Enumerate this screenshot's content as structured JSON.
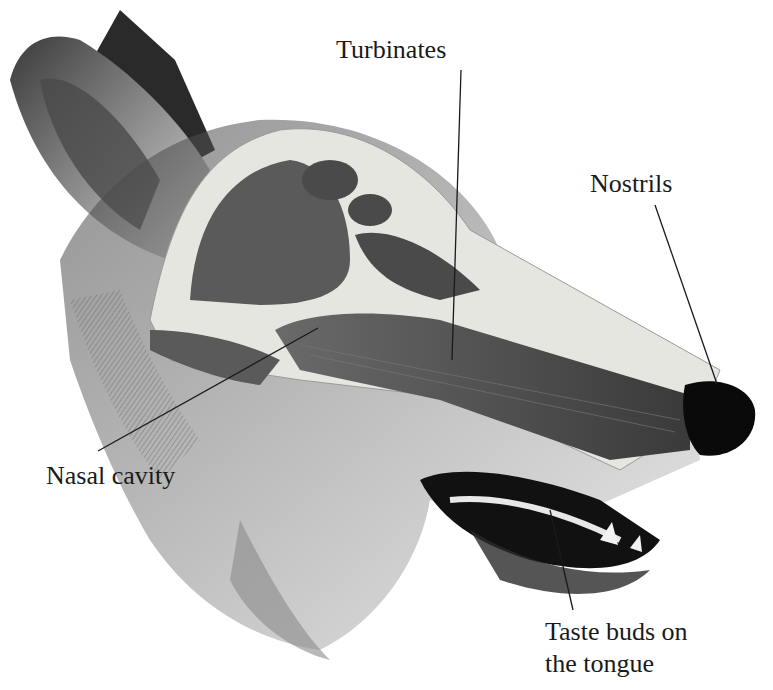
{
  "diagram": {
    "labels": [
      {
        "id": "turbinates",
        "text": "Turbinates",
        "x": 336,
        "y": 34
      },
      {
        "id": "nostrils",
        "text": "Nostrils",
        "x": 590,
        "y": 168
      },
      {
        "id": "nasal-cavity",
        "text": "Nasal cavity",
        "x": 46,
        "y": 460
      },
      {
        "id": "taste-buds",
        "line1": "Taste buds on",
        "line2": "the tongue",
        "x": 545,
        "y": 616
      }
    ],
    "leaders": [
      {
        "id": "turbinates",
        "x1": 461,
        "y1": 70,
        "x2": 452,
        "y2": 360
      },
      {
        "id": "nostrils",
        "x1": 655,
        "y1": 205,
        "x2": 717,
        "y2": 384
      },
      {
        "id": "nasal-cavity",
        "x1": 98,
        "y1": 451,
        "x2": 318,
        "y2": 328
      },
      {
        "id": "taste-buds",
        "x1": 573,
        "y1": 610,
        "x2": 550,
        "y2": 510
      }
    ],
    "colors": {
      "ink": "#1a1a1a",
      "fur_dark": "#2a2a2a",
      "fur_mid": "#6b6b6b",
      "bone": "#e6e6e0",
      "cavity": "#4a4a4a",
      "nose": "#0a0a0a",
      "background": "#ffffff"
    }
  }
}
